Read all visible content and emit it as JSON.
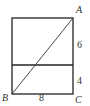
{
  "diagram": {
    "type": "geometry-rectangle",
    "stroke_color": "#222222",
    "points": {
      "A": {
        "label": "A"
      },
      "B": {
        "label": "B"
      },
      "C": {
        "label": "C"
      }
    },
    "measurements": {
      "bottom_side": "8",
      "right_upper_segment": "6",
      "right_lower_segment": "4"
    }
  }
}
